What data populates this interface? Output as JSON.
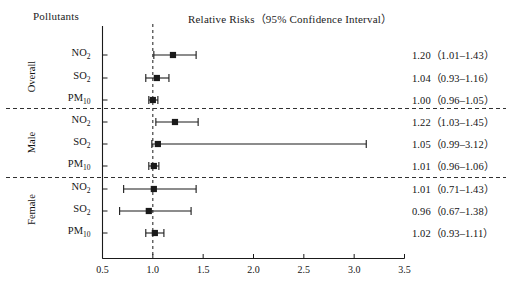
{
  "header": {
    "left_title": "Pollutants",
    "right_title": "Relative Risks（95% Confidence Interval）"
  },
  "axis": {
    "ticks": [
      "0.5",
      "1.0",
      "1.5",
      "2.0",
      "2.5",
      "3.0",
      "3.5"
    ],
    "reference_line_value": "1.0"
  },
  "groups": [
    {
      "name": "Overall"
    },
    {
      "name": "Male"
    },
    {
      "name": "Female"
    }
  ],
  "rows": [
    {
      "group": "Overall",
      "pollutant": "NO",
      "sub": "2",
      "value_label": "1.20（1.01–1.43）"
    },
    {
      "group": "Overall",
      "pollutant": "SO",
      "sub": "2",
      "value_label": "1.04（0.93–1.16）"
    },
    {
      "group": "Overall",
      "pollutant": "PM",
      "sub": "10",
      "value_label": "1.00（0.96–1.05）"
    },
    {
      "group": "Male",
      "pollutant": "NO",
      "sub": "2",
      "value_label": "1.22（1.03–1.45）"
    },
    {
      "group": "Male",
      "pollutant": "SO",
      "sub": "2",
      "value_label": "1.05（0.99–3.12）"
    },
    {
      "group": "Male",
      "pollutant": "PM",
      "sub": "10",
      "value_label": "1.01（0.96–1.06）"
    },
    {
      "group": "Female",
      "pollutant": "NO",
      "sub": "2",
      "value_label": "1.01（0.71–1.43）"
    },
    {
      "group": "Female",
      "pollutant": "SO",
      "sub": "2",
      "value_label": "0.96（0.67–1.38）"
    },
    {
      "group": "Female",
      "pollutant": "PM",
      "sub": "10",
      "value_label": "1.02（0.93–1.11）"
    }
  ],
  "chart_data": {
    "type": "scatter",
    "chart_subtype": "forest-plot",
    "title": "Relative Risks（95% Confidence Interval）",
    "xlabel": "",
    "ylabel": "Pollutants",
    "xlim": [
      0.5,
      3.5
    ],
    "xticks": [
      0.5,
      1.0,
      1.5,
      2.0,
      2.5,
      3.0,
      3.5
    ],
    "grid": false,
    "legend": "none",
    "reference_line": 1.0,
    "categories": [
      "Overall NO2",
      "Overall SO2",
      "Overall PM10",
      "Male NO2",
      "Male SO2",
      "Male PM10",
      "Female NO2",
      "Female SO2",
      "Female PM10"
    ],
    "estimates": [
      1.2,
      1.04,
      1.0,
      1.22,
      1.05,
      1.01,
      1.01,
      0.96,
      1.02
    ],
    "ci_lower": [
      1.01,
      0.93,
      0.96,
      1.03,
      0.99,
      0.96,
      0.71,
      0.67,
      0.93
    ],
    "ci_upper": [
      1.43,
      1.16,
      1.05,
      1.45,
      3.12,
      1.06,
      1.43,
      1.38,
      1.11
    ],
    "series": [
      {
        "name": "Overall",
        "points": [
          {
            "label": "NO2",
            "estimate": 1.2,
            "ci_lower": 1.01,
            "ci_upper": 1.43
          },
          {
            "label": "SO2",
            "estimate": 1.04,
            "ci_lower": 0.93,
            "ci_upper": 1.16
          },
          {
            "label": "PM10",
            "estimate": 1.0,
            "ci_lower": 0.96,
            "ci_upper": 1.05
          }
        ]
      },
      {
        "name": "Male",
        "points": [
          {
            "label": "NO2",
            "estimate": 1.22,
            "ci_lower": 1.03,
            "ci_upper": 1.45
          },
          {
            "label": "SO2",
            "estimate": 1.05,
            "ci_lower": 0.99,
            "ci_upper": 3.12
          },
          {
            "label": "PM10",
            "estimate": 1.01,
            "ci_lower": 0.96,
            "ci_upper": 1.06
          }
        ]
      },
      {
        "name": "Female",
        "points": [
          {
            "label": "NO2",
            "estimate": 1.01,
            "ci_lower": 0.71,
            "ci_upper": 1.43
          },
          {
            "label": "SO2",
            "estimate": 0.96,
            "ci_lower": 0.67,
            "ci_upper": 1.38
          },
          {
            "label": "PM10",
            "estimate": 1.02,
            "ci_lower": 0.93,
            "ci_upper": 1.11
          }
        ]
      }
    ]
  },
  "colors": {
    "ink": "#1a1a1a",
    "background": "#ffffff"
  }
}
